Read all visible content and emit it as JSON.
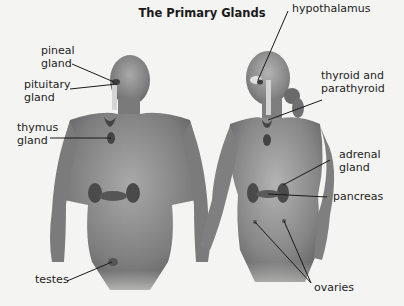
{
  "title": "The Primary Glands",
  "labels": {
    "pineal": "pineal\ngland",
    "pituitary": "pituitary\ngland",
    "thymus": "thymus\ngland",
    "testes": "testes",
    "hypothalamus": "hypothalamus",
    "thyroid": "thyroid and\nparathyroid",
    "adrenal": "adrenal\ngland",
    "pancreas": "pancreas",
    "ovaries": "ovaries"
  },
  "figures": [
    "male-body",
    "female-body"
  ],
  "colors": {
    "background": "#f4f4f2",
    "skin": "#8a8a8a",
    "gland": "#4a4a4a",
    "leader": "#1a1a1a"
  }
}
